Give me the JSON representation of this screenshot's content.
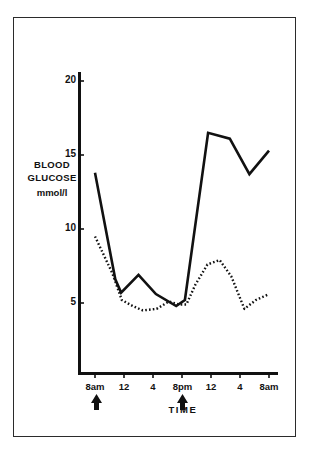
{
  "chart_data": {
    "type": "line",
    "title": "",
    "xlabel": "TIME",
    "ylabel": "BLOOD GLUCOSE",
    "yunits": "mmol/l",
    "ylim": [
      0,
      21
    ],
    "yticks": [
      5,
      10,
      15,
      20
    ],
    "ytick_labels": [
      "5",
      "10",
      "15",
      "20"
    ],
    "xticks": [
      8,
      12,
      16,
      20,
      24,
      28,
      32
    ],
    "xtick_labels": [
      "8am",
      "12",
      "4",
      "8pm",
      "12",
      "4",
      "8am"
    ],
    "grid": false,
    "legend": "none",
    "annotations": [
      {
        "name": "arrow-marker-morning",
        "x": 8,
        "label": ""
      },
      {
        "name": "arrow-marker-evening",
        "x": 20,
        "label": ""
      }
    ],
    "series": [
      {
        "name": "solid-line",
        "style": "solid",
        "color": "#111111",
        "x": [
          8,
          10.8,
          11.6,
          14,
          16.4,
          19.2,
          20.4,
          23.6,
          26.6,
          29.3,
          32
        ],
        "values": [
          13.8,
          6.6,
          5.7,
          6.9,
          5.6,
          4.8,
          5.2,
          16.5,
          16.1,
          13.7,
          15.3
        ]
      },
      {
        "name": "dotted-line",
        "style": "dotted",
        "color": "#111111",
        "x": [
          8,
          10.4,
          11.7,
          13.2,
          14.6,
          16.5,
          18.2,
          19.6,
          20.6,
          21.8,
          23.5,
          25.2,
          26.8,
          28.6,
          30.2,
          32
        ],
        "values": [
          9.5,
          7.0,
          5.2,
          4.8,
          4.5,
          4.6,
          5.1,
          4.9,
          4.9,
          6.2,
          7.6,
          7.9,
          6.8,
          4.6,
          5.2,
          5.6
        ]
      }
    ]
  }
}
